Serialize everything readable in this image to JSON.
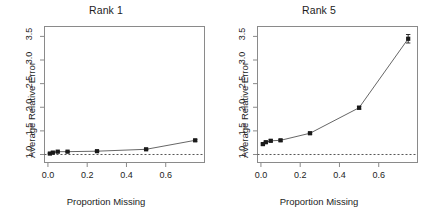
{
  "figure": {
    "background": "#ffffff",
    "line_color": "#555555",
    "point_color": "#1a1a1a",
    "axis_color": "#8a8a8a",
    "refline_color": "#555555"
  },
  "chart_data": [
    {
      "type": "line",
      "title": "Rank 1",
      "xlabel": "Proportion Missing",
      "ylabel": "Average Relative Error",
      "xlim": [
        -0.02,
        0.8
      ],
      "ylim": [
        0.82,
        3.72
      ],
      "xticks": [
        0.0,
        0.2,
        0.4,
        0.6
      ],
      "xtick_labels": [
        "0.0",
        "0.2",
        "0.4",
        "0.6"
      ],
      "yticks": [
        1.0,
        1.5,
        2.0,
        2.5,
        3.0,
        3.5
      ],
      "ytick_labels": [
        "1.0",
        "1.5",
        "2.0",
        "2.5",
        "3.0",
        "3.5"
      ],
      "grid": false,
      "legend": "none",
      "reference_line": {
        "y": 1.0,
        "style": "dashed",
        "label": "y = 1.0"
      },
      "series": [
        {
          "name": "Average Relative Error",
          "marker": "filled-square",
          "x": [
            0.01,
            0.025,
            0.05,
            0.1,
            0.25,
            0.5,
            0.75
          ],
          "values": [
            1.02,
            1.04,
            1.06,
            1.06,
            1.07,
            1.11,
            1.3
          ],
          "errors": [
            0.01,
            0.01,
            0.01,
            0.01,
            0.01,
            0.01,
            0.02
          ]
        }
      ]
    },
    {
      "type": "line",
      "title": "Rank 5",
      "xlabel": "Proportion Missing",
      "ylabel": "Average Relative Error",
      "xlim": [
        -0.02,
        0.8
      ],
      "ylim": [
        0.82,
        3.72
      ],
      "xticks": [
        0.0,
        0.2,
        0.4,
        0.6
      ],
      "xtick_labels": [
        "0.0",
        "0.2",
        "0.4",
        "0.6"
      ],
      "yticks": [
        1.0,
        1.5,
        2.0,
        2.5,
        3.0,
        3.5
      ],
      "ytick_labels": [
        "1.0",
        "1.5",
        "2.0",
        "2.5",
        "3.0",
        "3.5"
      ],
      "grid": false,
      "legend": "none",
      "reference_line": {
        "y": 1.0,
        "style": "dashed",
        "label": "y = 1.0"
      },
      "series": [
        {
          "name": "Average Relative Error",
          "marker": "filled-square",
          "x": [
            0.01,
            0.025,
            0.05,
            0.1,
            0.25,
            0.5,
            0.75
          ],
          "values": [
            1.22,
            1.26,
            1.29,
            1.3,
            1.45,
            1.99,
            3.45
          ],
          "errors": [
            0.02,
            0.02,
            0.02,
            0.02,
            0.02,
            0.03,
            0.09
          ]
        }
      ]
    }
  ]
}
